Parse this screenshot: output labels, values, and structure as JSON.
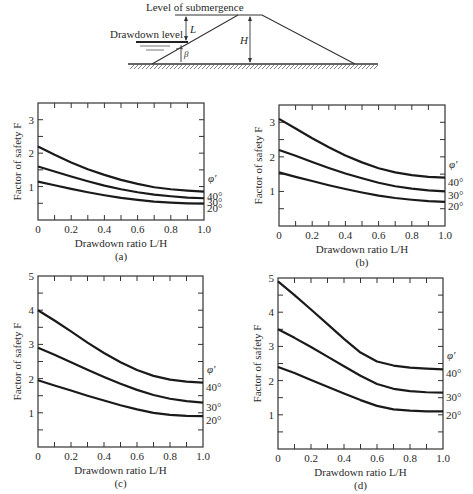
{
  "diagram": {
    "label_submergence": "Level of submergence",
    "label_drawdown": "Drawdown level",
    "label_L": "L",
    "label_H": "H",
    "label_beta": "β"
  },
  "chart_data": [
    {
      "type": "line",
      "panel": "(a)",
      "title": "",
      "xlabel": "Drawdown ratio L/H",
      "ylabel": "Factor of safety F",
      "xlim": [
        0,
        1.0
      ],
      "ylim": [
        0,
        3.5
      ],
      "xticks": [
        "0",
        "0.2",
        "0.4",
        "0.6",
        "0.8",
        "1.0"
      ],
      "yticks": [
        "1",
        "2",
        "3"
      ],
      "legend_title": "φ′",
      "x": [
        0,
        0.1,
        0.2,
        0.3,
        0.4,
        0.5,
        0.6,
        0.7,
        0.8,
        0.9,
        1.0
      ],
      "series": [
        {
          "name": "40°",
          "values": [
            2.2,
            1.95,
            1.72,
            1.52,
            1.35,
            1.2,
            1.08,
            0.98,
            0.92,
            0.88,
            0.85
          ]
        },
        {
          "name": "30°",
          "values": [
            1.6,
            1.45,
            1.3,
            1.16,
            1.03,
            0.92,
            0.83,
            0.76,
            0.71,
            0.67,
            0.65
          ]
        },
        {
          "name": "20°",
          "values": [
            1.15,
            1.04,
            0.93,
            0.83,
            0.74,
            0.66,
            0.6,
            0.55,
            0.52,
            0.5,
            0.49
          ]
        }
      ]
    },
    {
      "type": "line",
      "panel": "(b)",
      "title": "",
      "xlabel": "Drawdown ratio L/H",
      "ylabel": "Factor of safety F",
      "xlim": [
        0,
        1.0
      ],
      "ylim": [
        0,
        3.5
      ],
      "xticks": [
        "0",
        "0.2",
        "0.4",
        "0.6",
        "0.8",
        "1.0"
      ],
      "yticks": [
        "1",
        "2",
        "3"
      ],
      "legend_title": "φ′",
      "x": [
        0,
        0.1,
        0.2,
        0.3,
        0.4,
        0.5,
        0.6,
        0.7,
        0.8,
        0.9,
        1.0
      ],
      "series": [
        {
          "name": "40°",
          "values": [
            3.1,
            2.82,
            2.54,
            2.28,
            2.04,
            1.84,
            1.67,
            1.55,
            1.47,
            1.42,
            1.4
          ]
        },
        {
          "name": "30°",
          "values": [
            2.2,
            2.03,
            1.85,
            1.68,
            1.52,
            1.38,
            1.25,
            1.15,
            1.08,
            1.03,
            1.0
          ]
        },
        {
          "name": "20°",
          "values": [
            1.55,
            1.42,
            1.3,
            1.18,
            1.07,
            0.97,
            0.88,
            0.81,
            0.76,
            0.72,
            0.7
          ]
        }
      ]
    },
    {
      "type": "line",
      "panel": "(c)",
      "title": "",
      "xlabel": "Drawdown ratio L/H",
      "ylabel": "Factor of safety F",
      "xlim": [
        0,
        1.0
      ],
      "ylim": [
        0,
        5
      ],
      "xticks": [
        "0",
        "0.2",
        "0.4",
        "0.6",
        "0.8",
        "1.0"
      ],
      "yticks": [
        "1",
        "2",
        "3",
        "4",
        "5"
      ],
      "legend_title": "φ′",
      "x": [
        0,
        0.1,
        0.2,
        0.3,
        0.4,
        0.5,
        0.6,
        0.7,
        0.8,
        0.9,
        1.0
      ],
      "series": [
        {
          "name": "40°",
          "values": [
            4.0,
            3.7,
            3.38,
            3.05,
            2.75,
            2.48,
            2.25,
            2.08,
            1.97,
            1.91,
            1.88
          ]
        },
        {
          "name": "30°",
          "values": [
            2.9,
            2.7,
            2.48,
            2.26,
            2.05,
            1.85,
            1.67,
            1.52,
            1.41,
            1.34,
            1.3
          ]
        },
        {
          "name": "20°",
          "values": [
            1.95,
            1.8,
            1.65,
            1.5,
            1.36,
            1.22,
            1.1,
            1.0,
            0.94,
            0.91,
            0.9
          ]
        }
      ]
    },
    {
      "type": "line",
      "panel": "(d)",
      "title": "",
      "xlabel": "Drawdown ratio L/H",
      "ylabel": "Factor of safety F",
      "xlim": [
        0,
        1.0
      ],
      "ylim": [
        0,
        5
      ],
      "xticks": [
        "0",
        "0.2",
        "0.4",
        "0.6",
        "0.8",
        "1.0"
      ],
      "yticks": [
        "1",
        "2",
        "3",
        "4",
        "5"
      ],
      "legend_title": "φ′",
      "x": [
        0,
        0.1,
        0.2,
        0.3,
        0.4,
        0.5,
        0.6,
        0.7,
        0.8,
        0.9,
        1.0
      ],
      "series": [
        {
          "name": "40°",
          "values": [
            4.9,
            4.5,
            4.08,
            3.65,
            3.22,
            2.82,
            2.56,
            2.44,
            2.38,
            2.35,
            2.33
          ]
        },
        {
          "name": "30°",
          "values": [
            3.5,
            3.25,
            2.98,
            2.7,
            2.42,
            2.14,
            1.9,
            1.76,
            1.69,
            1.66,
            1.65
          ]
        },
        {
          "name": "20°",
          "values": [
            2.4,
            2.22,
            2.02,
            1.82,
            1.62,
            1.43,
            1.26,
            1.16,
            1.12,
            1.1,
            1.1
          ]
        }
      ]
    }
  ]
}
